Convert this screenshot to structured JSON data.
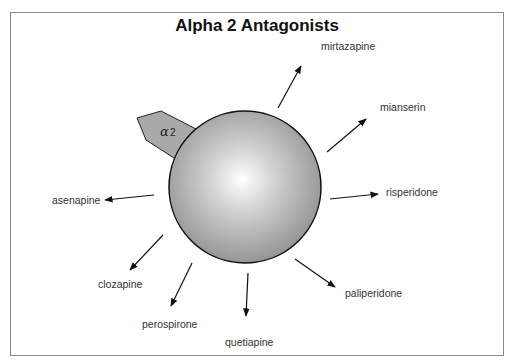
{
  "title": "Alpha 2 Antagonists",
  "receptor": {
    "label_symbol": "α",
    "label_sub": "2",
    "icon": "alpha-2-receptor-icon"
  },
  "center": {
    "shape": "sphere",
    "cx": 245,
    "cy": 187,
    "r": 76
  },
  "drugs": [
    {
      "name": "mirtazapine",
      "x": 321,
      "y": 46
    },
    {
      "name": "mianserin",
      "x": 380,
      "y": 106
    },
    {
      "name": "risperidone",
      "x": 386,
      "y": 184
    },
    {
      "name": "paliperidone",
      "x": 346,
      "y": 288
    },
    {
      "name": "quetiapine",
      "x": 238,
      "y": 338
    },
    {
      "name": "perospirone",
      "x": 142,
      "y": 318
    },
    {
      "name": "clozapine",
      "x": 98,
      "y": 278
    },
    {
      "name": "asenapine",
      "x": 52,
      "y": 195
    }
  ],
  "colors": {
    "sphere_edge": "#111111",
    "receptor_fill": "#a9a9a9",
    "border": "#8a8a8a"
  }
}
